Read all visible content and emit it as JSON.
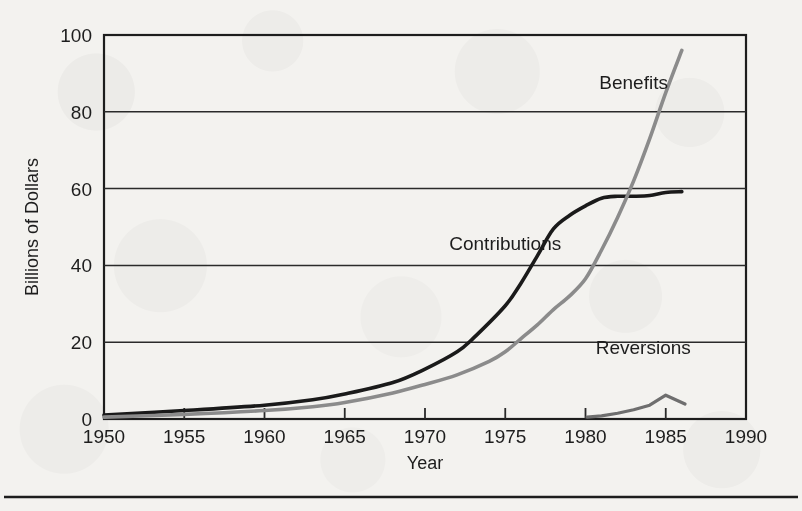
{
  "figure": {
    "background_color": "#f3f2ef",
    "frame_color": "#1d1d1d",
    "bottom_rule_color": "#1d1d1d"
  },
  "chart_data": {
    "type": "line",
    "title": "",
    "subtitle": "",
    "xlabel": "Year",
    "ylabel": "Billions of Dollars",
    "xlim": [
      1950,
      1990
    ],
    "ylim": [
      0,
      100
    ],
    "xticks": [
      1950,
      1955,
      1960,
      1965,
      1970,
      1975,
      1980,
      1985,
      1990
    ],
    "xtick_labels": [
      "1950",
      "1955",
      "1960",
      "1965",
      "1970",
      "1975",
      "1980",
      "1985",
      "1990"
    ],
    "yticks": [
      0,
      20,
      40,
      60,
      80,
      100
    ],
    "ytick_labels": [
      "0",
      "20",
      "40",
      "60",
      "80",
      "100"
    ],
    "grid": "horizontal",
    "legend_position": "inline-annotations",
    "series": [
      {
        "name": "Contributions",
        "color": "#1a1a1a",
        "line_width": 3.6,
        "label_x": 1975,
        "label_y": 44,
        "x": [
          1950,
          1955,
          1960,
          1963,
          1965,
          1968,
          1970,
          1972,
          1973,
          1975,
          1976,
          1977,
          1978,
          1979,
          1980,
          1981,
          1982,
          1983,
          1984,
          1985,
          1986
        ],
        "values": [
          1.0,
          2.2,
          3.6,
          5.0,
          6.5,
          9.5,
          13.0,
          17.5,
          21.0,
          29.5,
          35.5,
          42.5,
          49.5,
          53.0,
          55.5,
          57.5,
          58.0,
          58.0,
          58.2,
          59.0,
          59.2
        ]
      },
      {
        "name": "Benefits",
        "color": "#8b8b8b",
        "line_width": 3.6,
        "label_x": 1983,
        "label_y": 86,
        "x": [
          1950,
          1955,
          1960,
          1963,
          1965,
          1968,
          1970,
          1972,
          1974,
          1975,
          1976,
          1977,
          1978,
          1979,
          1980,
          1981,
          1982,
          1983,
          1984,
          1985,
          1986
        ],
        "values": [
          0.5,
          1.2,
          2.2,
          3.2,
          4.3,
          6.8,
          9.0,
          11.5,
          15.0,
          17.5,
          21.0,
          24.5,
          28.5,
          32.0,
          36.5,
          44.0,
          52.5,
          62.0,
          73.0,
          85.0,
          96.0
        ]
      },
      {
        "name": "Reversions",
        "color": "#6e6e6e",
        "line_width": 3.2,
        "label_x": 1983.6,
        "label_y": 17,
        "x": [
          1980.1,
          1981,
          1982,
          1983,
          1984,
          1985,
          1986.2
        ],
        "values": [
          0.5,
          0.8,
          1.5,
          2.4,
          3.6,
          6.2,
          3.9
        ]
      }
    ]
  }
}
